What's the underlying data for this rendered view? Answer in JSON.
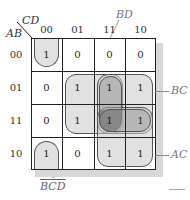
{
  "diagram": {
    "row_var": "AB",
    "col_var": "CD",
    "col_headers": [
      "00",
      "01",
      "11",
      "10"
    ],
    "row_headers": [
      "00",
      "01",
      "11",
      "10"
    ],
    "cells": [
      [
        "1",
        "0",
        "0",
        "0"
      ],
      [
        "0",
        "1",
        "1",
        "1"
      ],
      [
        "0",
        "1",
        "1",
        "1"
      ],
      [
        "1",
        "0",
        "1",
        "1"
      ]
    ],
    "groups": [
      {
        "label": "BD",
        "cells": "rows 01-11, cols 01-11"
      },
      {
        "label": "BC",
        "cells": "rows 01-11, cols 11-10"
      },
      {
        "label": "AC",
        "cells": "rows 11-10, cols 11-10"
      },
      {
        "label": "B̄C̄D̄",
        "cells": "rows 00,10, col 00 (wrap)"
      }
    ],
    "labels": {
      "bd": "BD",
      "bc": "BC",
      "ac": "AC",
      "bcd": "BCD"
    },
    "colors": {
      "grid_line": "#222222",
      "group_light": "#c8c8c8",
      "group_dark": "#646464",
      "shadow": "#d8d8d8"
    }
  }
}
